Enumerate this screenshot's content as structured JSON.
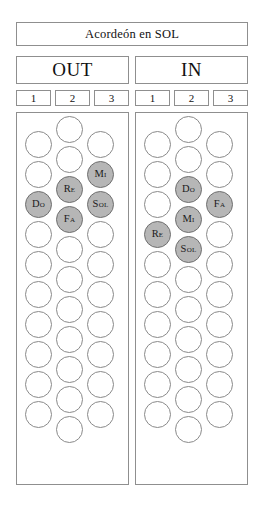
{
  "title": {
    "prefix": "Acordeón en ",
    "key": "SOL",
    "full": "Acordeón en SOL"
  },
  "colors": {
    "shaded_fill": "#b6b6b6",
    "shaded_border": "#6f6f6f",
    "open_fill": "#ffffff",
    "open_border": "#8a8a8a",
    "box_border": "#8f8f8f",
    "background": "#ffffff",
    "text": "#111111"
  },
  "panels": [
    {
      "id": "out",
      "header": "OUT",
      "column_numbers": [
        "1",
        "2",
        "3"
      ],
      "columns": [
        {
          "index": 1,
          "count": 10,
          "buttons": [
            {
              "pos": 1,
              "label": "",
              "shaded": false
            },
            {
              "pos": 2,
              "label": "",
              "shaded": false
            },
            {
              "pos": 3,
              "label": "Do",
              "shaded": true
            },
            {
              "pos": 4,
              "label": "",
              "shaded": false
            },
            {
              "pos": 5,
              "label": "",
              "shaded": false
            },
            {
              "pos": 6,
              "label": "",
              "shaded": false
            },
            {
              "pos": 7,
              "label": "",
              "shaded": false
            },
            {
              "pos": 8,
              "label": "",
              "shaded": false
            },
            {
              "pos": 9,
              "label": "",
              "shaded": false
            },
            {
              "pos": 10,
              "label": "",
              "shaded": false
            }
          ]
        },
        {
          "index": 2,
          "count": 11,
          "buttons": [
            {
              "pos": 1,
              "label": "",
              "shaded": false
            },
            {
              "pos": 2,
              "label": "",
              "shaded": false
            },
            {
              "pos": 3,
              "label": "Re",
              "shaded": true
            },
            {
              "pos": 4,
              "label": "Fa",
              "shaded": true
            },
            {
              "pos": 5,
              "label": "",
              "shaded": false
            },
            {
              "pos": 6,
              "label": "",
              "shaded": false
            },
            {
              "pos": 7,
              "label": "",
              "shaded": false
            },
            {
              "pos": 8,
              "label": "",
              "shaded": false
            },
            {
              "pos": 9,
              "label": "",
              "shaded": false
            },
            {
              "pos": 10,
              "label": "",
              "shaded": false
            },
            {
              "pos": 11,
              "label": "",
              "shaded": false
            }
          ]
        },
        {
          "index": 3,
          "count": 10,
          "buttons": [
            {
              "pos": 1,
              "label": "",
              "shaded": false
            },
            {
              "pos": 2,
              "label": "Mi",
              "shaded": true
            },
            {
              "pos": 3,
              "label": "Sol",
              "shaded": true
            },
            {
              "pos": 4,
              "label": "",
              "shaded": false
            },
            {
              "pos": 5,
              "label": "",
              "shaded": false
            },
            {
              "pos": 6,
              "label": "",
              "shaded": false
            },
            {
              "pos": 7,
              "label": "",
              "shaded": false
            },
            {
              "pos": 8,
              "label": "",
              "shaded": false
            },
            {
              "pos": 9,
              "label": "",
              "shaded": false
            },
            {
              "pos": 10,
              "label": "",
              "shaded": false
            }
          ]
        }
      ]
    },
    {
      "id": "in",
      "header": "IN",
      "column_numbers": [
        "1",
        "2",
        "3"
      ],
      "columns": [
        {
          "index": 1,
          "count": 10,
          "buttons": [
            {
              "pos": 1,
              "label": "",
              "shaded": false
            },
            {
              "pos": 2,
              "label": "",
              "shaded": false
            },
            {
              "pos": 3,
              "label": "",
              "shaded": false
            },
            {
              "pos": 4,
              "label": "Re",
              "shaded": true
            },
            {
              "pos": 5,
              "label": "",
              "shaded": false
            },
            {
              "pos": 6,
              "label": "",
              "shaded": false
            },
            {
              "pos": 7,
              "label": "",
              "shaded": false
            },
            {
              "pos": 8,
              "label": "",
              "shaded": false
            },
            {
              "pos": 9,
              "label": "",
              "shaded": false
            },
            {
              "pos": 10,
              "label": "",
              "shaded": false
            }
          ]
        },
        {
          "index": 2,
          "count": 11,
          "buttons": [
            {
              "pos": 1,
              "label": "",
              "shaded": false
            },
            {
              "pos": 2,
              "label": "",
              "shaded": false
            },
            {
              "pos": 3,
              "label": "Do",
              "shaded": true
            },
            {
              "pos": 4,
              "label": "Mi",
              "shaded": true
            },
            {
              "pos": 5,
              "label": "Sol",
              "shaded": true
            },
            {
              "pos": 6,
              "label": "",
              "shaded": false
            },
            {
              "pos": 7,
              "label": "",
              "shaded": false
            },
            {
              "pos": 8,
              "label": "",
              "shaded": false
            },
            {
              "pos": 9,
              "label": "",
              "shaded": false
            },
            {
              "pos": 10,
              "label": "",
              "shaded": false
            },
            {
              "pos": 11,
              "label": "",
              "shaded": false
            }
          ]
        },
        {
          "index": 3,
          "count": 10,
          "buttons": [
            {
              "pos": 1,
              "label": "",
              "shaded": false
            },
            {
              "pos": 2,
              "label": "",
              "shaded": false
            },
            {
              "pos": 3,
              "label": "Fa",
              "shaded": true
            },
            {
              "pos": 4,
              "label": "",
              "shaded": false
            },
            {
              "pos": 5,
              "label": "",
              "shaded": false
            },
            {
              "pos": 6,
              "label": "",
              "shaded": false
            },
            {
              "pos": 7,
              "label": "",
              "shaded": false
            },
            {
              "pos": 8,
              "label": "",
              "shaded": false
            },
            {
              "pos": 9,
              "label": "",
              "shaded": false
            },
            {
              "pos": 10,
              "label": "",
              "shaded": false
            }
          ]
        }
      ]
    }
  ],
  "geometry": {
    "circle_diameter": 27,
    "row_pitch": 30,
    "middle_column_offset": -15,
    "panel_top": 112,
    "panel_height": 373,
    "column_x_offsets": [
      8,
      39,
      70
    ],
    "first_row_top": 18
  }
}
